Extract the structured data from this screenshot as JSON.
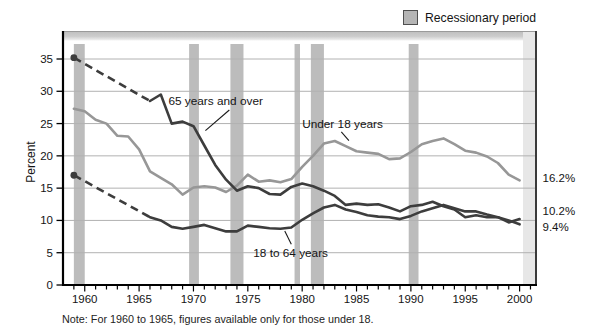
{
  "legend": {
    "label": "Recessionary period",
    "swatch_fill": "#b5b5b5",
    "swatch_border": "#4f4f4f"
  },
  "axes": {
    "y_title": "Percent",
    "y_ticks": [
      35,
      30,
      25,
      20,
      15,
      10,
      5,
      0
    ],
    "x_tick_labels": [
      "1960",
      "1965",
      "1970",
      "1975",
      "1980",
      "1985",
      "1990",
      "1995",
      "2000"
    ],
    "x_minor_start": 1959,
    "x_minor_end": 2001
  },
  "note": "Note: For 1960 to 1965, figures available only for those under 18.",
  "colors": {
    "dark_series": "#3d3d3d",
    "light_series": "#979797",
    "recession_band": "#bcbcbc",
    "gridline": "#b2b2b2",
    "axis": "#000000",
    "frame": "#3a3a3a",
    "text": "#141414"
  },
  "chart_data": {
    "type": "line",
    "ylabel": "Percent",
    "ylim": [
      0,
      37.5
    ],
    "xlim": [
      1958,
      2001.6
    ],
    "grid": "horizontal",
    "legend_position": "top-right",
    "recession_periods": [
      [
        1959.0,
        1960.0
      ],
      [
        1969.6,
        1970.5
      ],
      [
        1973.4,
        1974.6
      ],
      [
        1979.3,
        1979.8
      ],
      [
        1980.8,
        1982.0
      ],
      [
        1989.8,
        1990.7
      ]
    ],
    "series": [
      {
        "name": "Under 18 years",
        "color": "#979797",
        "style": "solid",
        "points": [
          [
            1959,
            27.3
          ],
          [
            1960,
            26.9
          ],
          [
            1961,
            25.6
          ],
          [
            1962,
            25.0
          ],
          [
            1963,
            23.1
          ],
          [
            1964,
            23.0
          ],
          [
            1965,
            21.0
          ],
          [
            1966,
            17.6
          ],
          [
            1967,
            16.6
          ],
          [
            1968,
            15.6
          ],
          [
            1969,
            14.0
          ],
          [
            1970,
            15.1
          ],
          [
            1971,
            15.3
          ],
          [
            1972,
            15.1
          ],
          [
            1973,
            14.4
          ],
          [
            1974,
            15.4
          ],
          [
            1975,
            17.1
          ],
          [
            1976,
            16.0
          ],
          [
            1977,
            16.2
          ],
          [
            1978,
            15.9
          ],
          [
            1979,
            16.4
          ],
          [
            1980,
            18.3
          ],
          [
            1981,
            20.0
          ],
          [
            1982,
            21.9
          ],
          [
            1983,
            22.3
          ],
          [
            1984,
            21.5
          ],
          [
            1985,
            20.7
          ],
          [
            1986,
            20.5
          ],
          [
            1987,
            20.3
          ],
          [
            1988,
            19.5
          ],
          [
            1989,
            19.6
          ],
          [
            1990,
            20.6
          ],
          [
            1991,
            21.8
          ],
          [
            1992,
            22.3
          ],
          [
            1993,
            22.7
          ],
          [
            1994,
            21.8
          ],
          [
            1995,
            20.8
          ],
          [
            1996,
            20.5
          ],
          [
            1997,
            19.9
          ],
          [
            1998,
            18.9
          ],
          [
            1999,
            17.1
          ],
          [
            2000,
            16.2
          ]
        ]
      },
      {
        "name": "65 years and over",
        "color": "#3d3d3d",
        "style": "solid",
        "start_dot": [
          1959,
          35.2
        ],
        "dashed_segment": [
          [
            1959,
            35.2
          ],
          [
            1966,
            28.5
          ]
        ],
        "points": [
          [
            1966,
            28.5
          ],
          [
            1967,
            29.5
          ],
          [
            1968,
            25.0
          ],
          [
            1969,
            25.3
          ],
          [
            1970,
            24.6
          ],
          [
            1971,
            21.6
          ],
          [
            1972,
            18.6
          ],
          [
            1973,
            16.3
          ],
          [
            1974,
            14.6
          ],
          [
            1975,
            15.3
          ],
          [
            1976,
            15.0
          ],
          [
            1977,
            14.1
          ],
          [
            1978,
            14.0
          ],
          [
            1979,
            15.2
          ],
          [
            1980,
            15.7
          ],
          [
            1981,
            15.3
          ],
          [
            1982,
            14.6
          ],
          [
            1983,
            13.8
          ],
          [
            1984,
            12.4
          ],
          [
            1985,
            12.6
          ],
          [
            1986,
            12.4
          ],
          [
            1987,
            12.5
          ],
          [
            1988,
            12.0
          ],
          [
            1989,
            11.4
          ],
          [
            1990,
            12.2
          ],
          [
            1991,
            12.4
          ],
          [
            1992,
            12.9
          ],
          [
            1993,
            12.2
          ],
          [
            1994,
            11.7
          ],
          [
            1995,
            10.5
          ],
          [
            1996,
            10.8
          ],
          [
            1997,
            10.5
          ],
          [
            1998,
            10.5
          ],
          [
            1999,
            9.7
          ],
          [
            2000,
            10.2
          ]
        ]
      },
      {
        "name": "18 to 64 years",
        "color": "#3d3d3d",
        "style": "solid",
        "start_dot": [
          1959,
          17.0
        ],
        "dashed_segment": [
          [
            1959,
            17.0
          ],
          [
            1966,
            10.5
          ]
        ],
        "points": [
          [
            1966,
            10.5
          ],
          [
            1967,
            10.0
          ],
          [
            1968,
            9.0
          ],
          [
            1969,
            8.7
          ],
          [
            1970,
            9.0
          ],
          [
            1971,
            9.3
          ],
          [
            1972,
            8.8
          ],
          [
            1973,
            8.3
          ],
          [
            1974,
            8.3
          ],
          [
            1975,
            9.2
          ],
          [
            1976,
            9.0
          ],
          [
            1977,
            8.8
          ],
          [
            1978,
            8.7
          ],
          [
            1979,
            8.9
          ],
          [
            1980,
            10.1
          ],
          [
            1981,
            11.1
          ],
          [
            1982,
            12.0
          ],
          [
            1983,
            12.4
          ],
          [
            1984,
            11.7
          ],
          [
            1985,
            11.3
          ],
          [
            1986,
            10.8
          ],
          [
            1987,
            10.6
          ],
          [
            1988,
            10.5
          ],
          [
            1989,
            10.2
          ],
          [
            1990,
            10.7
          ],
          [
            1991,
            11.4
          ],
          [
            1992,
            11.9
          ],
          [
            1993,
            12.4
          ],
          [
            1994,
            11.9
          ],
          [
            1995,
            11.4
          ],
          [
            1996,
            11.4
          ],
          [
            1997,
            10.9
          ],
          [
            1998,
            10.5
          ],
          [
            1999,
            10.0
          ],
          [
            2000,
            9.4
          ]
        ]
      }
    ],
    "end_labels": [
      {
        "text": "16.2%",
        "series": "Under 18 years",
        "value": 16.2,
        "label_center_value": 16.6
      },
      {
        "text": "10.2%",
        "series": "65 years and over",
        "value": 10.2,
        "label_center_value": 11.4
      },
      {
        "text": "9.4%",
        "series": "18 to 64 years",
        "value": 9.4,
        "label_center_value": 9.0
      }
    ],
    "annotations": [
      {
        "text": "65 years and over",
        "text_year": 1967.7,
        "text_value": 27.85,
        "leader": [
          [
            1973.3,
            27.1
          ],
          [
            1971.1,
            23.9
          ]
        ]
      },
      {
        "text": "Under 18 years",
        "text_year": 1980.0,
        "text_value": 24.3,
        "leader": [
          [
            1983.6,
            23.7
          ],
          [
            1984.3,
            22.35
          ]
        ]
      },
      {
        "text": "18 to 64 years",
        "text_year": 1975.5,
        "text_value": 4.35,
        "leader": [
          [
            1978.4,
            8.35
          ],
          [
            1979.0,
            6.3
          ]
        ]
      }
    ]
  }
}
